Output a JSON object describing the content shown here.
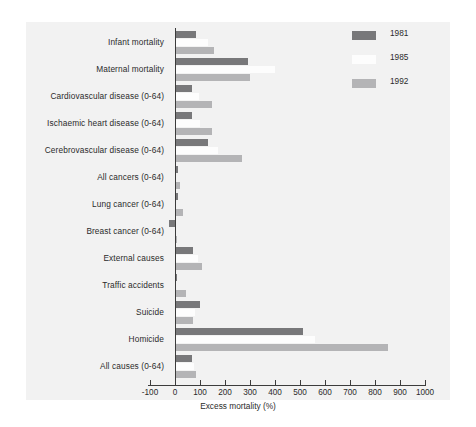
{
  "chart_data": {
    "type": "bar",
    "orientation": "horizontal",
    "title": "",
    "xlabel": "Excess mortality (%)",
    "ylabel": "",
    "xlim": [
      -100,
      1000
    ],
    "xticks": [
      -100,
      0,
      100,
      200,
      300,
      400,
      500,
      600,
      700,
      800,
      900,
      1000
    ],
    "xtick_labels": [
      "-100",
      "0",
      "100",
      "200",
      "300",
      "400",
      "500",
      "600",
      "700",
      "800",
      "900",
      "1000"
    ],
    "grid": false,
    "legend_position": "top-right",
    "categories": [
      "Infant mortality",
      "Maternal mortality",
      "Cardiovascular disease (0-64)",
      "Ischaemic heart disease (0-64)",
      "Cerebrovascular disease (0-64)",
      "All cancers (0-64)",
      "Lung cancer (0-64)",
      "Breast cancer (0-64)",
      "External causes",
      "Traffic accidents",
      "Suicide",
      "Homicide",
      "All causes (0-64)"
    ],
    "series": [
      {
        "name": "1981",
        "color": "#78787a",
        "values": [
          85,
          290,
          68,
          68,
          130,
          12,
          10,
          -25,
          72,
          8,
          100,
          510,
          68
        ]
      },
      {
        "name": "1985",
        "color": "#fdfdfd",
        "values": [
          130,
          400,
          95,
          100,
          170,
          5,
          4,
          4,
          90,
          5,
          80,
          560,
          75
        ]
      },
      {
        "name": "1992",
        "color": "#b4b4b6",
        "values": [
          155,
          300,
          148,
          148,
          268,
          18,
          30,
          8,
          108,
          45,
          72,
          850,
          85
        ]
      }
    ]
  },
  "legend": {
    "entries": [
      {
        "label": "1981",
        "color": "#78787a"
      },
      {
        "label": "1985",
        "color": "#fdfdfd"
      },
      {
        "label": "1992",
        "color": "#b4b4b6"
      }
    ]
  },
  "axis": {
    "x_title": "Excess mortality (%)"
  },
  "colors": {
    "panel_background": "#f2f2f2",
    "figure_background": "#ffffff",
    "axis": "#3c3c3c",
    "text": "#2b2b2b"
  }
}
